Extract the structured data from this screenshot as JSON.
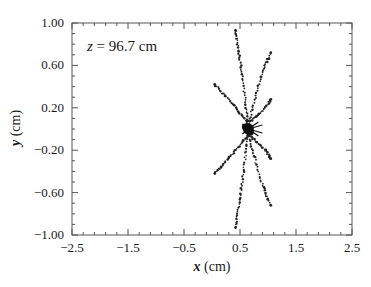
{
  "chart_data": {
    "type": "scatter",
    "title": "",
    "annotation": {
      "var": "z",
      "text": " = 96.7 cm"
    },
    "xlabel": {
      "var": "x",
      "unit": " (cm)"
    },
    "ylabel": {
      "var": "y",
      "unit": " (cm)"
    },
    "xlim": [
      -2.5,
      2.5
    ],
    "ylim": [
      -1.0,
      1.0
    ],
    "xticks": [
      -2.5,
      -1.5,
      -0.5,
      0.5,
      1.5,
      2.5
    ],
    "xtick_labels": [
      "−2.5",
      "−1.5",
      "−0.5",
      "0.5",
      "1.5",
      "2.5"
    ],
    "yticks": [
      1.0,
      0.6,
      0.2,
      -0.2,
      -0.6,
      -1.0
    ],
    "ytick_labels": [
      "1.00",
      "0.60",
      "0.20",
      "−0.20",
      "−0.60",
      "−1.00"
    ],
    "grid": false,
    "legend": null,
    "center": {
      "x": 0.65,
      "y": 0.0
    },
    "series": [
      {
        "name": "trail-up-vertical",
        "points": [
          [
            0.65,
            0.05
          ],
          [
            0.6,
            0.25
          ],
          [
            0.55,
            0.45
          ],
          [
            0.5,
            0.65
          ],
          [
            0.45,
            0.82
          ],
          [
            0.42,
            0.93
          ]
        ]
      },
      {
        "name": "trail-up-left",
        "points": [
          [
            0.65,
            0.05
          ],
          [
            0.5,
            0.15
          ],
          [
            0.35,
            0.25
          ],
          [
            0.2,
            0.33
          ],
          [
            0.05,
            0.42
          ]
        ]
      },
      {
        "name": "trail-up-right-long",
        "points": [
          [
            0.65,
            0.05
          ],
          [
            0.75,
            0.25
          ],
          [
            0.85,
            0.45
          ],
          [
            0.95,
            0.6
          ],
          [
            1.05,
            0.72
          ]
        ]
      },
      {
        "name": "trail-up-right-short",
        "points": [
          [
            0.65,
            0.05
          ],
          [
            0.8,
            0.12
          ],
          [
            0.95,
            0.2
          ],
          [
            1.05,
            0.28
          ]
        ]
      },
      {
        "name": "trail-down-vertical",
        "points": [
          [
            0.65,
            -0.05
          ],
          [
            0.6,
            -0.25
          ],
          [
            0.55,
            -0.45
          ],
          [
            0.5,
            -0.65
          ],
          [
            0.45,
            -0.82
          ],
          [
            0.42,
            -0.93
          ]
        ]
      },
      {
        "name": "trail-down-left",
        "points": [
          [
            0.65,
            -0.05
          ],
          [
            0.5,
            -0.15
          ],
          [
            0.35,
            -0.25
          ],
          [
            0.2,
            -0.33
          ],
          [
            0.05,
            -0.42
          ]
        ]
      },
      {
        "name": "trail-down-right-long",
        "points": [
          [
            0.65,
            -0.05
          ],
          [
            0.75,
            -0.25
          ],
          [
            0.85,
            -0.45
          ],
          [
            0.95,
            -0.6
          ],
          [
            1.05,
            -0.72
          ]
        ]
      },
      {
        "name": "trail-down-right-short",
        "points": [
          [
            0.65,
            -0.05
          ],
          [
            0.8,
            -0.12
          ],
          [
            0.95,
            -0.2
          ],
          [
            1.05,
            -0.28
          ]
        ]
      }
    ]
  }
}
